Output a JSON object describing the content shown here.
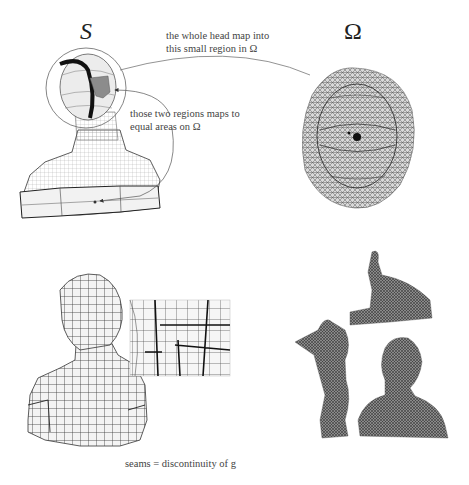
{
  "figure": {
    "top_left": {
      "symbol": "S",
      "description": "3D bust mesh with head region circled and two marked regions"
    },
    "top_right": {
      "symbol": "Ω",
      "description": "Flattened parameter domain mesh (disk-like) with dense triangulation"
    },
    "annotations": {
      "head_map_line1": "the whole head map into",
      "head_map_line2": "this small region in Ω",
      "regions_line1": "those two regions maps to",
      "regions_line2": "equal areas on Ω"
    },
    "bottom_left": {
      "description": "Bust mesh with checkerboard grid texture and zoomed inset showing seams",
      "caption": "seams = discontinuity of g"
    },
    "bottom_right": {
      "description": "Three cut mesh pieces of the bust (atlas charts)"
    }
  }
}
